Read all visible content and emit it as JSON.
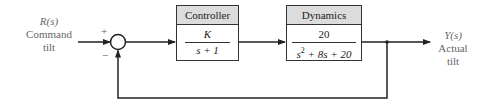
{
  "input": {
    "symbol": "R(s)",
    "line1": "Command",
    "line2": "tilt"
  },
  "output": {
    "symbol": "Y(s)",
    "line1": "Actual",
    "line2": "tilt"
  },
  "summing_junction": {
    "plus": "+",
    "minus": "−"
  },
  "controller": {
    "title": "Controller",
    "numerator": "K",
    "denominator": "s + 1"
  },
  "dynamics": {
    "title": "Dynamics",
    "numerator": "20",
    "denominator_s": "s",
    "denominator_exp": "2",
    "denominator_rest": " + 8s + 20"
  },
  "colors": {
    "line": "#222222",
    "header_fill": "#dcdcdc",
    "label": "#666666"
  }
}
